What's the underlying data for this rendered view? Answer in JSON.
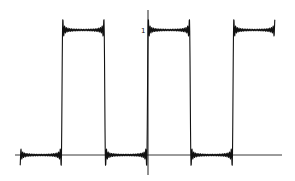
{
  "chart_data": {
    "type": "line",
    "title": "",
    "xlabel": "",
    "ylabel": "",
    "y_tick_labels": [
      "1"
    ],
    "ylim": [
      -0.15,
      1.15
    ],
    "levels": {
      "low": 0,
      "high": 1
    },
    "period_px": 85.5,
    "jump_x_px": [
      62,
      104,
      148,
      190,
      233,
      275
    ],
    "start": {
      "x_px": 20,
      "value": 0.5
    },
    "end": {
      "x_px": 275,
      "value": 0.5
    },
    "grid": false,
    "legend": null,
    "colors": {
      "line": "#111111",
      "axis": "#111111",
      "background": "#ffffff"
    }
  },
  "axes": {
    "y_tick_label": "1"
  }
}
